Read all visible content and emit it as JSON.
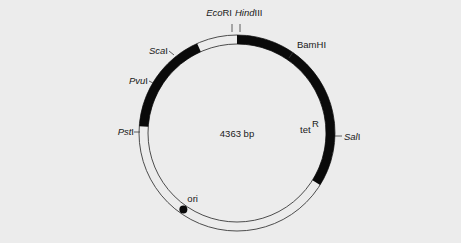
{
  "diagram": {
    "type": "plasmid-map",
    "size_label": "4363 bp",
    "colors": {
      "background": "#ececec",
      "gene": "#0a0a0a",
      "line": "#3a3a3a"
    },
    "geometry": {
      "cx": 237,
      "cy": 133,
      "r_outer": 98,
      "r_inner": 89
    },
    "genes": [
      {
        "name": "tetR",
        "label": "tet",
        "superscript": "R",
        "start_deg": -90,
        "end_deg": 32
      },
      {
        "name": "ampR",
        "label": "",
        "superscript": "",
        "start_deg": 184,
        "end_deg": 246
      }
    ],
    "sites": [
      {
        "name": "EcoRI",
        "italic": "Eco",
        "roman": "RI",
        "angle": -94
      },
      {
        "name": "HindIII",
        "italic": "Hind",
        "roman": "III",
        "angle": -90
      },
      {
        "name": "BamHI",
        "italic": "",
        "roman": "BamHI",
        "angle": -55
      },
      {
        "name": "SalI",
        "italic": "Sal",
        "roman": "I",
        "angle": 2
      },
      {
        "name": "PstI",
        "italic": "Pst",
        "roman": "I",
        "angle": 180
      },
      {
        "name": "PvuI",
        "italic": "Pvu",
        "roman": "I",
        "angle": 205
      },
      {
        "name": "ScaI",
        "italic": "Sca",
        "roman": "I",
        "angle": 230
      }
    ],
    "ori": {
      "label": "ori",
      "angle": 125
    }
  }
}
